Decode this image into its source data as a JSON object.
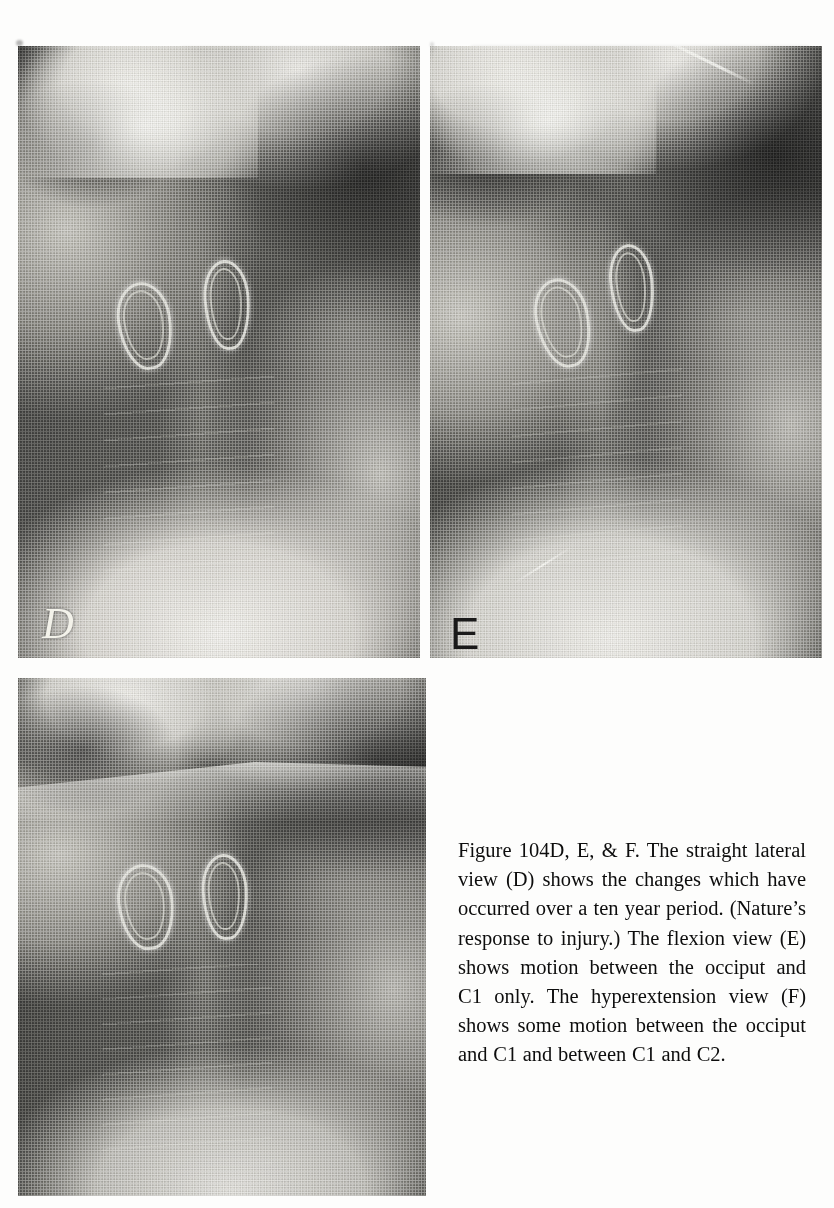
{
  "page": {
    "running_head": "",
    "background_color": "#fdfdfc",
    "width": 834,
    "height": 1208
  },
  "figure": {
    "panels": [
      {
        "id": "panel-d",
        "letter": "D",
        "label_style": "light",
        "view": "straight lateral view",
        "position": {
          "x": 18,
          "y": 46,
          "width": 402,
          "height": 612
        }
      },
      {
        "id": "panel-e",
        "letter": "E",
        "label_style": "dark",
        "view": "flexion view",
        "position": {
          "x": 430,
          "y": 46,
          "width": 392,
          "height": 612
        }
      },
      {
        "id": "panel-f",
        "letter": "",
        "label_style": "none",
        "view": "hyperextension view",
        "position": {
          "x": 18,
          "y": 678,
          "width": 408,
          "height": 518
        }
      }
    ],
    "modality": "cervical spine radiograph",
    "artifacts": [
      {
        "name": "wire-loop-artifact",
        "count": 2,
        "description": "bright metallic loop"
      }
    ]
  },
  "caption": {
    "text": "Figure 104D, E, & F. The straight lateral view (D) shows the changes which have occurred over a ten year period. (Nature’s response to injury.) The flexion view (E) shows motion between the occiput and C1 only. The hyperextension view (F) shows some motion between the occiput and C1 and between C1 and C2.",
    "figure_number": "Figure 104D, E, & F.",
    "lines": [
      "Figure 104D, E, & F. The straight",
      "lateral view (D) shows the",
      "changes which have occurred over",
      "a ten year period. (Nature’s re-",
      "sponse to injury.) The flexion view",
      "(E) shows motion between the oc-",
      "ciput and C1 only. The hyperex-",
      "tension view (F) shows some",
      "motion between the occiput and",
      "C1 and between C1 and C2."
    ]
  },
  "colors": {
    "page_background": "#fdfdfc",
    "text": "#0d0d0d",
    "film_dark": "#3a3a3a",
    "film_mid": "#6e6e6e",
    "film_bright": "#e8e8e4",
    "label_light": "#f3f2ea",
    "label_dark": "#1a1a1a"
  }
}
